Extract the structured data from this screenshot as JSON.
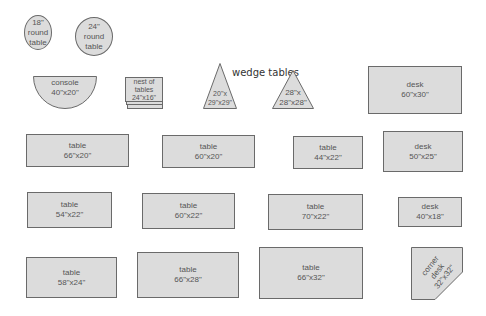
{
  "diagram": {
    "heading": "wedge tables",
    "colors": {
      "fill": "#dcdcdc",
      "stroke": "#6a6a6a",
      "text": "#555555"
    },
    "pieces": [
      {
        "id": "round18",
        "shape": "circle",
        "lines": [
          "18\"",
          "round",
          "table"
        ]
      },
      {
        "id": "round24",
        "shape": "circle",
        "lines": [
          "24\"",
          "round",
          "table"
        ]
      },
      {
        "id": "console",
        "shape": "half-circle",
        "lines": [
          "console",
          "40\"x20\""
        ]
      },
      {
        "id": "nest",
        "shape": "stacked-rect",
        "lines": [
          "nest of",
          "tables",
          "24\"x16\""
        ]
      },
      {
        "id": "wedge20",
        "shape": "triangle",
        "lines": [
          "20\"x",
          "29\"x29\""
        ]
      },
      {
        "id": "wedge28",
        "shape": "triangle",
        "lines": [
          "28\"x",
          "28\"x28\""
        ]
      },
      {
        "id": "desk6030",
        "shape": "rect",
        "lines": [
          "desk",
          "60\"x30\""
        ]
      },
      {
        "id": "t6620",
        "shape": "rect",
        "lines": [
          "table",
          "66\"x20\""
        ]
      },
      {
        "id": "t6020",
        "shape": "rect",
        "lines": [
          "table",
          "60\"x20\""
        ]
      },
      {
        "id": "t4422",
        "shape": "rect",
        "lines": [
          "table",
          "44\"x22\""
        ]
      },
      {
        "id": "desk5025",
        "shape": "rect",
        "lines": [
          "desk",
          "50\"x25\""
        ]
      },
      {
        "id": "t5422",
        "shape": "rect",
        "lines": [
          "table",
          "54\"x22\""
        ]
      },
      {
        "id": "t6022",
        "shape": "rect",
        "lines": [
          "table",
          "60\"x22\""
        ]
      },
      {
        "id": "t7022",
        "shape": "rect",
        "lines": [
          "table",
          "70\"x22\""
        ]
      },
      {
        "id": "desk4018",
        "shape": "rect",
        "lines": [
          "desk",
          "40\"x18\""
        ]
      },
      {
        "id": "t5824",
        "shape": "rect",
        "lines": [
          "table",
          "58\"x24\""
        ]
      },
      {
        "id": "t6628",
        "shape": "rect",
        "lines": [
          "table",
          "66\"x28\""
        ]
      },
      {
        "id": "t6632",
        "shape": "rect",
        "lines": [
          "table",
          "66\"x32\""
        ]
      },
      {
        "id": "corner",
        "shape": "corner-pentagon",
        "lines": [
          "corner",
          "desk",
          "32\"x32\""
        ]
      }
    ]
  }
}
